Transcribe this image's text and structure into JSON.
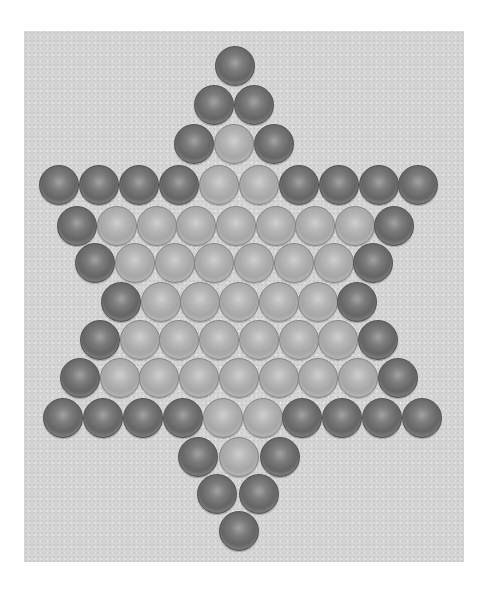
{
  "board": {
    "name": "chinese-checkers-star-board",
    "colors": {
      "background": "#d5d5d5",
      "dark_marble": "#626262",
      "light_marble": "#a8a8a8"
    },
    "ball_diameter": 40,
    "rows": [
      {
        "y": 66,
        "balls": [
          {
            "x": 235,
            "c": "dark"
          }
        ]
      },
      {
        "y": 105,
        "balls": [
          {
            "x": 214,
            "c": "dark"
          },
          {
            "x": 254,
            "c": "dark"
          }
        ]
      },
      {
        "y": 144,
        "balls": [
          {
            "x": 194,
            "c": "dark"
          },
          {
            "x": 234,
            "c": "light"
          },
          {
            "x": 274,
            "c": "dark"
          }
        ]
      },
      {
        "y": 185,
        "balls": [
          {
            "x": 59,
            "c": "dark"
          },
          {
            "x": 99,
            "c": "dark"
          },
          {
            "x": 139,
            "c": "dark"
          },
          {
            "x": 179,
            "c": "dark"
          },
          {
            "x": 219,
            "c": "light"
          },
          {
            "x": 259,
            "c": "light"
          },
          {
            "x": 299,
            "c": "dark"
          },
          {
            "x": 339,
            "c": "dark"
          },
          {
            "x": 379,
            "c": "dark"
          },
          {
            "x": 418,
            "c": "dark"
          }
        ]
      },
      {
        "y": 226,
        "balls": [
          {
            "x": 77,
            "c": "dark"
          },
          {
            "x": 117,
            "c": "light"
          },
          {
            "x": 157,
            "c": "light"
          },
          {
            "x": 196,
            "c": "light"
          },
          {
            "x": 236,
            "c": "light"
          },
          {
            "x": 276,
            "c": "light"
          },
          {
            "x": 315,
            "c": "light"
          },
          {
            "x": 355,
            "c": "light"
          },
          {
            "x": 394,
            "c": "dark"
          }
        ]
      },
      {
        "y": 263,
        "balls": [
          {
            "x": 95,
            "c": "dark"
          },
          {
            "x": 135,
            "c": "light"
          },
          {
            "x": 175,
            "c": "light"
          },
          {
            "x": 214,
            "c": "light"
          },
          {
            "x": 254,
            "c": "light"
          },
          {
            "x": 294,
            "c": "light"
          },
          {
            "x": 334,
            "c": "light"
          },
          {
            "x": 373,
            "c": "dark"
          }
        ]
      },
      {
        "y": 302,
        "balls": [
          {
            "x": 121,
            "c": "dark"
          },
          {
            "x": 161,
            "c": "light"
          },
          {
            "x": 200,
            "c": "light"
          },
          {
            "x": 239,
            "c": "light"
          },
          {
            "x": 279,
            "c": "light"
          },
          {
            "x": 318,
            "c": "light"
          },
          {
            "x": 357,
            "c": "dark"
          }
        ]
      },
      {
        "y": 340,
        "balls": [
          {
            "x": 100,
            "c": "dark"
          },
          {
            "x": 140,
            "c": "light"
          },
          {
            "x": 179,
            "c": "light"
          },
          {
            "x": 219,
            "c": "light"
          },
          {
            "x": 259,
            "c": "light"
          },
          {
            "x": 299,
            "c": "light"
          },
          {
            "x": 338,
            "c": "light"
          },
          {
            "x": 378,
            "c": "dark"
          }
        ]
      },
      {
        "y": 378,
        "balls": [
          {
            "x": 80,
            "c": "dark"
          },
          {
            "x": 120,
            "c": "light"
          },
          {
            "x": 159,
            "c": "light"
          },
          {
            "x": 199,
            "c": "light"
          },
          {
            "x": 239,
            "c": "light"
          },
          {
            "x": 279,
            "c": "light"
          },
          {
            "x": 318,
            "c": "light"
          },
          {
            "x": 358,
            "c": "light"
          },
          {
            "x": 398,
            "c": "dark"
          }
        ]
      },
      {
        "y": 418,
        "balls": [
          {
            "x": 63,
            "c": "dark"
          },
          {
            "x": 103,
            "c": "dark"
          },
          {
            "x": 143,
            "c": "dark"
          },
          {
            "x": 183,
            "c": "dark"
          },
          {
            "x": 223,
            "c": "light"
          },
          {
            "x": 263,
            "c": "light"
          },
          {
            "x": 302,
            "c": "dark"
          },
          {
            "x": 342,
            "c": "dark"
          },
          {
            "x": 382,
            "c": "dark"
          },
          {
            "x": 422,
            "c": "dark"
          }
        ]
      },
      {
        "y": 457,
        "balls": [
          {
            "x": 198,
            "c": "dark"
          },
          {
            "x": 239,
            "c": "light"
          },
          {
            "x": 280,
            "c": "dark"
          }
        ]
      },
      {
        "y": 494,
        "balls": [
          {
            "x": 217,
            "c": "dark"
          },
          {
            "x": 259,
            "c": "dark"
          }
        ]
      },
      {
        "y": 531,
        "balls": [
          {
            "x": 239,
            "c": "dark"
          }
        ]
      }
    ]
  }
}
